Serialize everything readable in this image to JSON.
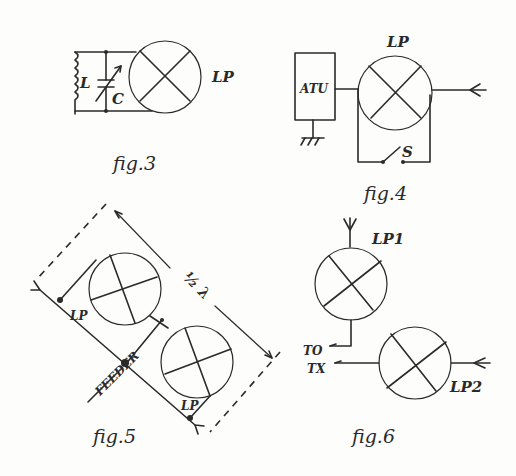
{
  "figures": {
    "fig3": {
      "caption": "fig.3",
      "loop_label": "LP",
      "inductor_label": "L",
      "capacitor_label": "C"
    },
    "fig4": {
      "caption": "fig.4",
      "loop_label": "LP",
      "tuner_label": "ATU",
      "switch_label": "S"
    },
    "fig5": {
      "caption": "fig.5",
      "spacing_label": "½ λ",
      "loop_label_upper": "LP",
      "loop_label_lower": "LP",
      "feeder_label": "FEEDER"
    },
    "fig6": {
      "caption": "fig.6",
      "loop1_label": "LP1",
      "loop2_label": "LP2",
      "output_label_line1": "TO",
      "output_label_line2": "TX"
    }
  },
  "colors": {
    "ink": "#2a2a2a",
    "paper": "#fdfdfc"
  }
}
